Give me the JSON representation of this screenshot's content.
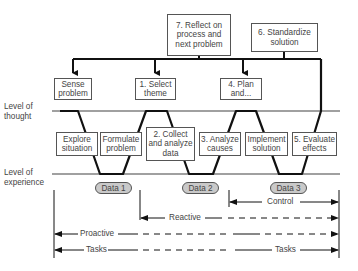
{
  "diagram": {
    "top_boxes": {
      "reflect": "7. Reflect on\nprocess and\nnext problem",
      "standardize": "6. Standardize\nsolution"
    },
    "thought_boxes": {
      "sense": "Sense\nproblem",
      "select": "1. Select\ntheme",
      "plan": "4. Plan\nand..."
    },
    "levels": {
      "thought": "Level of\nthought",
      "experience": "Level of\nexperience"
    },
    "middle_boxes": {
      "explore": "Explore\nsituation",
      "formulate": "Formulate\nproblem",
      "collect": "2. Collect\nand analyze\ndata",
      "analyze": "3. Analyze\ncauses",
      "implement": "Implement\nsolution",
      "evaluate": "5. Evaluate\neffects"
    },
    "data_nodes": [
      "Data 1",
      "Data 2",
      "Data 3"
    ],
    "spans": {
      "control": "Control",
      "reactive": "Reactive",
      "proactive": "Proactive",
      "tasks_left": "Tasks",
      "tasks_right": "Tasks"
    },
    "colors": {
      "line": "#111111",
      "level_line": "#a0a0a0",
      "oval_fill": "#c9c9c9",
      "box_border": "#555555"
    }
  }
}
